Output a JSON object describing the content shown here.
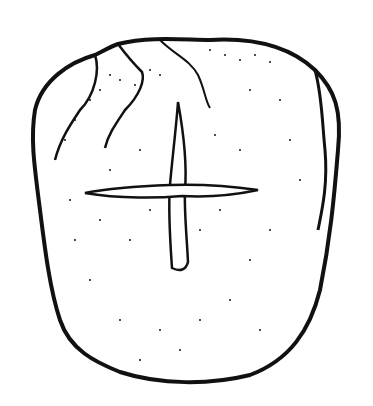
{
  "figure": {
    "style": "Ink stipple drawing",
    "colors": {
      "background": "#ffffff",
      "ink": "#111111"
    }
  }
}
